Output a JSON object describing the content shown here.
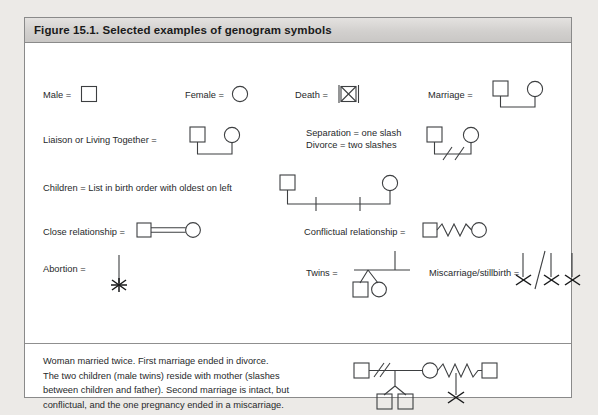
{
  "figure": {
    "title": "Figure 15.1. Selected examples of genogram symbols",
    "legend": {
      "male": "Male =",
      "female": "Female =",
      "death": "Death =",
      "marriage": "Marriage =",
      "liaison": "Liaison or Living Together =",
      "separation": "Separation = one slash",
      "divorce": "Divorce = two slashes",
      "children": "Children = List in birth order with oldest on left",
      "close_relationship": "Close relationship =",
      "conflictual_relationship": "Conflictual relationship =",
      "abortion": "Abortion =",
      "twins": "Twins =",
      "miscarriage": "Miscarriage/stillbirth ="
    },
    "caption": "Woman married twice. First marriage ended in divorce.\nThe two children (male twins) reside with mother (slashes\nbetween children and father). Second marriage is intact, but\nconflictual, and the one pregnancy ended in a miscarriage.",
    "colors": {
      "page_background": "#eceae7",
      "figure_background": "#ffffff",
      "header_band": "#d2d0ce",
      "border": "#8a8a8a",
      "symbol_stroke": "#3d3f41",
      "text": "#27292b"
    },
    "symbols": [
      {
        "name": "male-symbol",
        "shape": "square"
      },
      {
        "name": "female-symbol",
        "shape": "circle"
      },
      {
        "name": "death-symbol",
        "shape": "square-with-x-and-bars"
      },
      {
        "name": "marriage-symbol",
        "shape": "square-circle-joined-below"
      },
      {
        "name": "liaison-symbol",
        "shape": "square-circle-joined-below"
      },
      {
        "name": "separation-divorce-symbol",
        "shape": "square-circle-joined-with-two-slashes"
      },
      {
        "name": "children-symbol",
        "shape": "couple-with-two-child-drop-lines"
      },
      {
        "name": "close-relationship-symbol",
        "shape": "square-circle-double-line"
      },
      {
        "name": "conflictual-relationship-symbol",
        "shape": "square-circle-zigzag-line"
      },
      {
        "name": "abortion-symbol",
        "shape": "vertical-line-with-asterisk-x"
      },
      {
        "name": "twins-symbol",
        "shape": "drop-line-forking-to-square-and-circle"
      },
      {
        "name": "miscarriage-symbol",
        "shape": "three-drop-lines-with-x-and-slash"
      },
      {
        "name": "example-genogram",
        "shape": "full-family-genogram"
      }
    ]
  }
}
